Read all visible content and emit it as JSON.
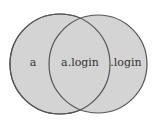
{
  "diagram": {
    "type": "venn",
    "sets": [
      {
        "label": "a"
      },
      {
        "label": ".login"
      }
    ],
    "intersection_label": "a.login",
    "colors": {
      "fill": "#d4d4d4",
      "stroke": "#555555"
    }
  }
}
